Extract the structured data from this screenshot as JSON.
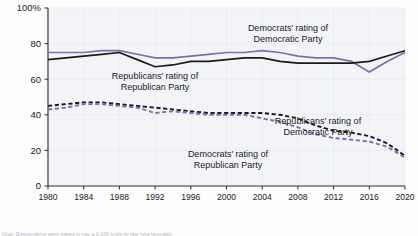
{
  "chart_data": {
    "type": "line",
    "title": "",
    "xlabel": "",
    "ylabel": "",
    "xlim": [
      1980,
      2020
    ],
    "ylim": [
      0,
      100
    ],
    "grid": true,
    "legend_position": "inline-annotations",
    "x": [
      1980,
      1982,
      1984,
      1986,
      1988,
      1990,
      1992,
      1994,
      1996,
      1998,
      2000,
      2002,
      2004,
      2006,
      2008,
      2010,
      2012,
      2014,
      2016,
      2018,
      2020
    ],
    "series": [
      {
        "name": "Democrats' rating of Democratic Party",
        "style": "solid",
        "color": "#7b6fb0",
        "values": [
          75,
          75,
          75,
          76,
          76,
          74,
          72,
          72,
          73,
          74,
          75,
          75,
          76,
          75,
          73,
          72,
          72,
          70,
          64,
          70,
          75
        ]
      },
      {
        "name": "Republicans' rating of Republican Party",
        "style": "solid",
        "color": "#1a1a1a",
        "values": [
          71,
          72,
          73,
          74,
          75,
          71,
          67,
          68,
          70,
          70,
          71,
          72,
          72,
          70,
          69,
          69,
          69,
          69,
          70,
          73,
          76
        ]
      },
      {
        "name": "Republicans' rating of Democratic Party",
        "style": "dashed",
        "color": "#1a1a1a",
        "values": [
          45,
          46,
          47,
          47,
          46,
          45,
          44,
          43,
          42,
          41,
          41,
          41,
          41,
          40,
          38,
          34,
          31,
          30,
          28,
          24,
          17
        ]
      },
      {
        "name": "Democrats' rating of Republican Party",
        "style": "dashed",
        "color": "#7b6fb0",
        "values": [
          43,
          44,
          46,
          46,
          45,
          44,
          41,
          42,
          41,
          40,
          40,
          40,
          38,
          36,
          33,
          29,
          27,
          26,
          25,
          22,
          16
        ]
      }
    ],
    "y_ticks": [
      {
        "value": 100,
        "label": "100%"
      },
      {
        "value": 80,
        "label": "80"
      },
      {
        "value": 60,
        "label": "60"
      },
      {
        "value": 40,
        "label": "40"
      },
      {
        "value": 20,
        "label": "20"
      },
      {
        "value": 0,
        "label": "0"
      }
    ],
    "x_ticks": [
      {
        "value": 1980,
        "label": "1980"
      },
      {
        "value": 1984,
        "label": "1984"
      },
      {
        "value": 1988,
        "label": "1988"
      },
      {
        "value": 1992,
        "label": "1992"
      },
      {
        "value": 1996,
        "label": "1996"
      },
      {
        "value": 2000,
        "label": "2000"
      },
      {
        "value": 2004,
        "label": "2004"
      },
      {
        "value": 2008,
        "label": "2008"
      },
      {
        "value": 2012,
        "label": "2012"
      },
      {
        "value": 2016,
        "label": "2016"
      },
      {
        "value": 2020,
        "label": "2020"
      }
    ],
    "annotations": [
      {
        "id": "dem-rating-dem-party",
        "lines": [
          "Democrats' rating of",
          "Democratic Party"
        ],
        "x_px": 288,
        "y_px": 31,
        "anchor": "middle"
      },
      {
        "id": "rep-rating-rep-party",
        "lines": [
          "Republicans' rating of",
          "Republican Party"
        ],
        "x_px": 155,
        "y_px": 79,
        "anchor": "middle"
      },
      {
        "id": "rep-rating-dem-party",
        "lines": [
          "Republicans' rating of",
          "Democratic Party"
        ],
        "x_px": 318,
        "y_px": 124,
        "anchor": "middle"
      },
      {
        "id": "dem-rating-rep-party",
        "lines": [
          "Democrats' rating of",
          "Republican Party"
        ],
        "x_px": 228,
        "y_px": 157,
        "anchor": "middle"
      }
    ]
  },
  "footnote": {
    "text": "Note: Respondents were asked to use a 0-100 scale to rate how favorably"
  },
  "colors": {
    "purple": "#7b6fb0",
    "black": "#1a1a1a",
    "plot_background": "#f3f4f8",
    "grid": "#e7e9f0"
  }
}
